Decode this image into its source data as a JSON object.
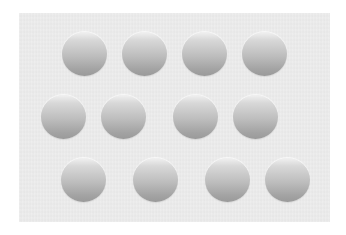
{
  "image": {
    "description": "Grid of shaded gray discs on a light gray panel (shape-from-shading: light at top, dark at bottom)",
    "background_color": "#ffffff",
    "panel_color": "#ececec",
    "disc_gradient": {
      "top": "#f1f1f1",
      "bottom": "#9a9a9a"
    },
    "lighting_direction": "from-above",
    "rows": [
      {
        "discs": [
          {
            "cx": 84,
            "cy": 54
          },
          {
            "cx": 144,
            "cy": 54
          },
          {
            "cx": 204,
            "cy": 54
          },
          {
            "cx": 264,
            "cy": 54
          }
        ]
      },
      {
        "discs": [
          {
            "cx": 63,
            "cy": 117
          },
          {
            "cx": 123,
            "cy": 117
          },
          {
            "cx": 195,
            "cy": 117
          },
          {
            "cx": 255,
            "cy": 117
          }
        ]
      },
      {
        "discs": [
          {
            "cx": 83,
            "cy": 180
          },
          {
            "cx": 155,
            "cy": 180
          },
          {
            "cx": 227,
            "cy": 180
          },
          {
            "cx": 287,
            "cy": 180
          }
        ]
      }
    ],
    "disc_count": 12,
    "disc_radius": 22
  }
}
